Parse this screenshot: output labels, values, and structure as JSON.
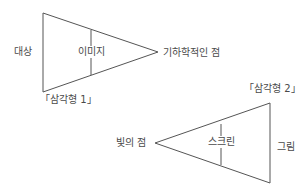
{
  "colors": {
    "line": "#555555",
    "text": "#4a4a4a",
    "background": "#ffffff"
  },
  "triangle1": {
    "caption": "「삼각형 1」",
    "left_label": "대상",
    "middle_label": "이미지",
    "apex_label": "기하학적인 점",
    "points": "43,13 43,92 158,52",
    "divider": {
      "x": 91,
      "y1": 30,
      "y2": 75
    }
  },
  "triangle2": {
    "caption": "「삼각형 2」",
    "apex_label": "빛의 점",
    "middle_label": "스크린",
    "right_label": "그림",
    "points": "155,143 270,103 270,183",
    "divider": {
      "x": 221,
      "y1": 124,
      "y2": 165
    }
  }
}
